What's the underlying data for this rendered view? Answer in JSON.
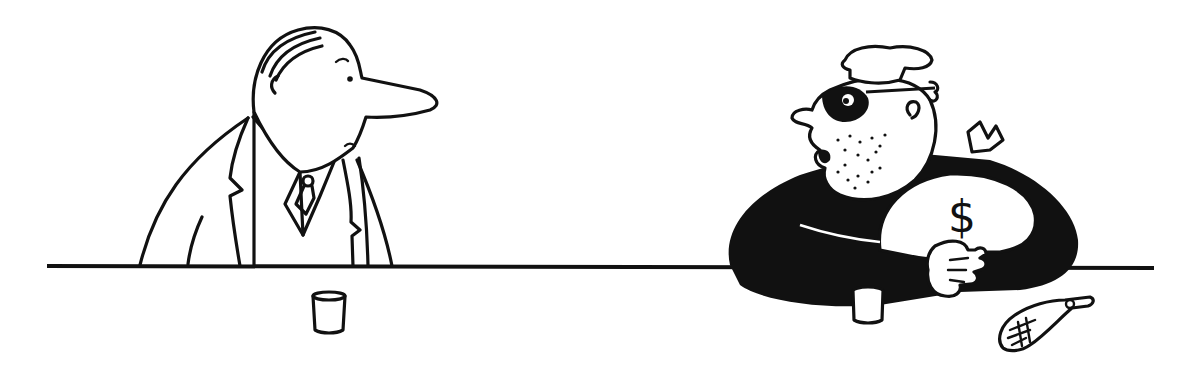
{
  "scene": {
    "description": "Single-panel cartoon: a man in a suit at a bar counter looks at a masked burglar holding a money bag",
    "background_color": "#ffffff",
    "ink_color": "#111111"
  },
  "characters": [
    {
      "id": "man-in-suit",
      "description": "Man with long nose wearing suit, shirt and tie, standing behind counter"
    },
    {
      "id": "burglar",
      "description": "Stubbly burglar with eye mask, cap and black sweater clutching a money bag"
    }
  ],
  "props": {
    "money_bag_symbol": "$",
    "glasses": 2,
    "counter": "bar counter line",
    "floor_object": "fish-like coin purse / bag on the floor"
  }
}
